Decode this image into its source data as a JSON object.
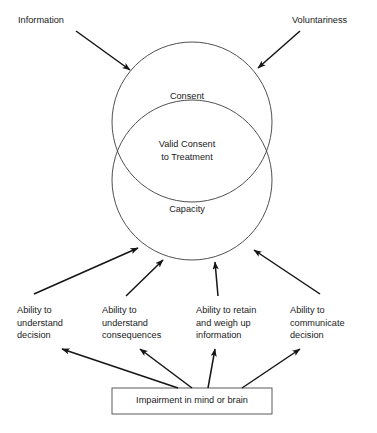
{
  "diagram": {
    "title": "Valid Consent to Treatment",
    "type": "venn-flow-diagram",
    "stroke_color": "#3c3c3c",
    "text_color": "#1a1a1a",
    "background": "#ffffff",
    "circles": {
      "consent": {
        "label": "Consent",
        "cx": 192,
        "cy": 122,
        "r": 80
      },
      "capacity": {
        "label": "Capacity",
        "cx": 192,
        "cy": 180,
        "r": 80
      },
      "overlap": {
        "label": "Valid Consent\nto Treatment"
      }
    },
    "top_inputs": [
      {
        "label": "Information",
        "arrow_from": [
          76,
          31
        ],
        "arrow_to": [
          130,
          70
        ]
      },
      {
        "label": "Voluntariness",
        "arrow_from": [
          300,
          31
        ],
        "arrow_to": [
          258,
          68
        ]
      }
    ],
    "capacity_factors": [
      {
        "label": "Ability to\nunderstand\ndecision",
        "arrow_from": [
          34,
          294
        ],
        "arrow_to": [
          138,
          248
        ]
      },
      {
        "label": "Ability to\nunderstand\nconsequences",
        "arrow_from": [
          126,
          296
        ],
        "arrow_to": [
          163,
          260
        ]
      },
      {
        "label": "Ability to retain\nand weigh up\ninformation",
        "arrow_from": [
          218,
          296
        ],
        "arrow_to": [
          215,
          262
        ]
      },
      {
        "label": "Ability to\ncommunicate\ndecision",
        "arrow_from": [
          320,
          294
        ],
        "arrow_to": [
          254,
          250
        ]
      }
    ],
    "impairment_box": {
      "label": "Impairment in mind or brain",
      "x": 112,
      "y": 388,
      "width": 160,
      "height": 26,
      "arrows_to_factors": [
        {
          "from": [
            178,
            388
          ],
          "to": [
            62,
            349
          ]
        },
        {
          "from": [
            192,
            388
          ],
          "to": [
            140,
            349
          ]
        },
        {
          "from": [
            208,
            388
          ],
          "to": [
            215,
            349
          ]
        },
        {
          "from": [
            242,
            388
          ],
          "to": [
            300,
            349
          ]
        }
      ]
    }
  }
}
